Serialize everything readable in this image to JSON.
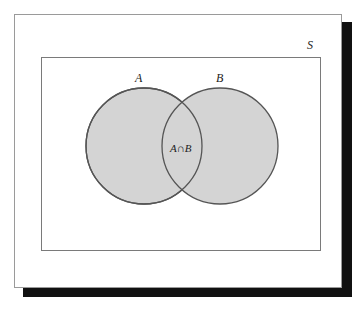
{
  "diagram": {
    "type": "venn",
    "universe_label": "S",
    "sets": [
      {
        "label": "A"
      },
      {
        "label": "B"
      }
    ],
    "intersection_label": "A∩B",
    "colors": {
      "fill": "#d4d4d4",
      "stroke": "#555555",
      "universe_stroke": "#7a7a7a",
      "shadow": "#111111"
    }
  }
}
